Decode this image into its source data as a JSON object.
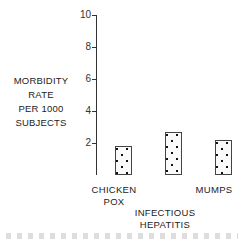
{
  "chart_data": {
    "type": "bar",
    "title": "",
    "xlabel": "",
    "ylabel": "MORBIDITY RATE PER 1000 SUBJECTS",
    "ylabel_lines": [
      "MORBIDITY",
      "RATE",
      "PER 1000",
      "SUBJECTS"
    ],
    "ylim": [
      0,
      10
    ],
    "yticks": [
      2,
      4,
      6,
      8,
      10
    ],
    "grid": false,
    "legend": null,
    "categories": [
      "CHICKEN POX",
      "INFECTIOUS HEPATITIS",
      "MUMPS"
    ],
    "category_lines": [
      [
        "CHICKEN",
        "POX"
      ],
      [
        "INFECTIOUS",
        "HEPATITIS"
      ],
      [
        "MUMPS"
      ]
    ],
    "series": [
      {
        "name": "solid (black) bars",
        "pattern": "solid",
        "color": "#151515",
        "values": [
          5.0,
          9.4,
          2.7
        ]
      },
      {
        "name": "dotted (stippled) bars",
        "pattern": "dotted",
        "color": "#fafafa",
        "values": [
          1.8,
          2.7,
          2.2
        ]
      }
    ]
  }
}
